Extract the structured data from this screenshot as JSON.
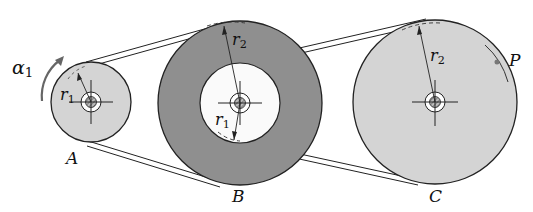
{
  "diagram": {
    "type": "belt-pulley-system",
    "pulleys": [
      {
        "id": "A",
        "label": "A",
        "radius_label": "r",
        "radius_sub": "1"
      },
      {
        "id": "B",
        "label": "B",
        "outer_radius_label": "r",
        "outer_radius_sub": "2",
        "inner_radius_label": "r",
        "inner_radius_sub": "1"
      },
      {
        "id": "C",
        "label": "C",
        "radius_label": "r",
        "radius_sub": "2",
        "point_label": "P"
      }
    ],
    "angular_accel_label": "α",
    "angular_accel_sub": "1",
    "colors": {
      "pulley_light": "#d4d4d4",
      "pulley_dark": "#8f8f8f",
      "stroke": "#222222",
      "arrow": "#666666"
    }
  }
}
